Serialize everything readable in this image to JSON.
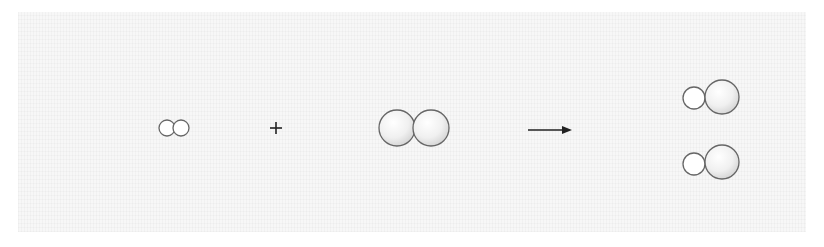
{
  "diagram": {
    "type": "reaction-scheme",
    "reactants": [
      {
        "id": "small-diatomic",
        "atoms": [
          {
            "size": "small"
          },
          {
            "size": "small"
          }
        ]
      },
      {
        "id": "large-diatomic",
        "atoms": [
          {
            "size": "large"
          },
          {
            "size": "large"
          }
        ]
      }
    ],
    "operator": "+",
    "arrow": "→",
    "products": [
      {
        "id": "product-1",
        "atoms": [
          {
            "size": "small"
          },
          {
            "size": "large"
          }
        ]
      },
      {
        "id": "product-2",
        "atoms": [
          {
            "size": "small"
          },
          {
            "size": "large"
          }
        ]
      }
    ],
    "colors": {
      "stroke": "#666666",
      "fill_light": "#ffffff",
      "fill_shade": "#d8d8d8",
      "background": "#f7f7f7"
    }
  }
}
